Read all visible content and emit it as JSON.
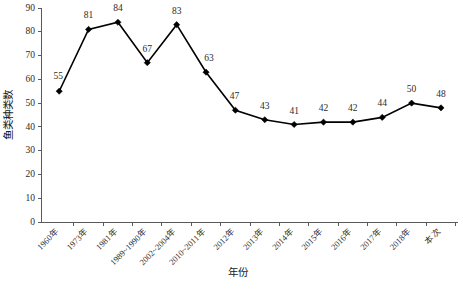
{
  "chart_data": {
    "type": "line",
    "title": "",
    "xlabel": "年份",
    "ylabel": "鱼类种类数",
    "ylim": [
      0,
      90
    ],
    "ytick_step": 10,
    "yticks": [
      "0",
      "10",
      "20",
      "30",
      "40",
      "50",
      "60",
      "70",
      "80",
      "90"
    ],
    "grid": false,
    "legend": "none",
    "marker": "diamond",
    "line_color": "#000000",
    "marker_color": "#000000",
    "show_data_labels": true,
    "categories": [
      "1960年",
      "1973年",
      "1981年",
      "1989~1990年",
      "2002~2004年",
      "2010~2011年",
      "2012年",
      "2013年",
      "2014年",
      "2015年",
      "2016年",
      "2017年",
      "2018年",
      "本次"
    ],
    "values": [
      55,
      81,
      84,
      67,
      83,
      63,
      47,
      43,
      41,
      42,
      42,
      44,
      50,
      48
    ],
    "series": [
      {
        "name": "鱼类种类数",
        "values": [
          55,
          81,
          84,
          67,
          83,
          63,
          47,
          43,
          41,
          42,
          42,
          44,
          50,
          48
        ]
      }
    ]
  }
}
